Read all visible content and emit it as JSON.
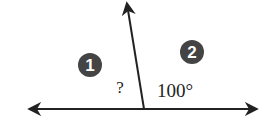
{
  "diagram": {
    "type": "supplementary-angles",
    "region_labels": [
      {
        "id": "1",
        "x": 90,
        "y": 65
      },
      {
        "id": "2",
        "x": 192,
        "y": 52
      }
    ],
    "angle_labels": {
      "unknown": "?",
      "known": "100°"
    },
    "colors": {
      "line": "#222222",
      "badge": "#444444"
    }
  }
}
